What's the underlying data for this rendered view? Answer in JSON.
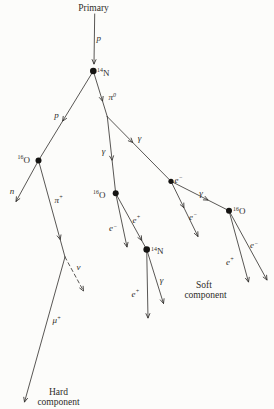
{
  "figure": {
    "caption_labels": {
      "primary": "Primary",
      "soft_line1": "Soft",
      "soft_line2": "component",
      "hard_line1": "Hard",
      "hard_line2": "component"
    },
    "particles": {
      "proton": "p",
      "neutron": "n",
      "pion_neutral_base": "π",
      "pion_neutral_sup": "0",
      "pion_plus_base": "π",
      "pion_plus_sup": "+",
      "muon_base": "μ",
      "muon_sup": "+",
      "neutrino": "ν",
      "gamma": "γ",
      "electron_base": "e",
      "electron_sup": "−",
      "positron_base": "e",
      "positron_sup": "+",
      "nitrogen_sup": "14",
      "nitrogen_base": "N",
      "oxygen_sup": "16",
      "oxygen_base": "O"
    }
  },
  "diagram": {
    "canvas": {
      "w": 274,
      "h": 409,
      "bg": "#fcfcfa",
      "ink": "#2e2c29"
    },
    "dots": [
      {
        "name": "n14-top-vertex-dot",
        "x": 93.3,
        "y": 71,
        "r": 3.3
      },
      {
        "name": "o16-left-vertex-dot",
        "x": 38.5,
        "y": 160.5,
        "r": 3.0
      },
      {
        "name": "o16-center-vertex-dot",
        "x": 115.7,
        "y": 193.3,
        "r": 3.0
      },
      {
        "name": "electron-vertex-dot",
        "x": 171,
        "y": 181.3,
        "r": 2.6
      },
      {
        "name": "o16-right-vertex-dot",
        "x": 229,
        "y": 210.7,
        "r": 3.0
      },
      {
        "name": "n14-bottom-vertex-dot",
        "x": 146.7,
        "y": 249.5,
        "r": 3.3
      }
    ],
    "edges": [
      {
        "name": "primary-proton-track",
        "x1": 94.7,
        "y1": 14,
        "x2": 94,
        "y2": 64,
        "arrows": [
          1
        ],
        "dashed": false
      },
      {
        "name": "proton-track",
        "x1": 93.3,
        "y1": 71,
        "x2": 38.5,
        "y2": 160.5,
        "arrows": [
          0.56
        ],
        "dashed": false
      },
      {
        "name": "pion0-track",
        "x1": 93.3,
        "y1": 71,
        "x2": 107.3,
        "y2": 116.7,
        "arrows": [
          0.66
        ],
        "dashed": false
      },
      {
        "name": "neutron-track",
        "x1": 38.5,
        "y1": 160.5,
        "x2": 16,
        "y2": 201.5,
        "arrows": [
          1
        ],
        "dashed": false
      },
      {
        "name": "pion-plus-track",
        "x1": 38.5,
        "y1": 160.5,
        "x2": 65,
        "y2": 257,
        "arrows": [
          0.82
        ],
        "dashed": false
      },
      {
        "name": "neutrino-track",
        "x1": 65,
        "y1": 257,
        "x2": 83.5,
        "y2": 291,
        "arrows": [
          1
        ],
        "dashed": true
      },
      {
        "name": "muon-track",
        "x1": 65,
        "y1": 257,
        "x2": 24.5,
        "y2": 402,
        "arrows": [
          1
        ],
        "dashed": false
      },
      {
        "name": "gamma-left-track",
        "x1": 107.3,
        "y1": 116.7,
        "x2": 115.7,
        "y2": 193.3,
        "arrows": [
          0.57
        ],
        "dashed": false
      },
      {
        "name": "gamma-right-track",
        "x1": 107.3,
        "y1": 116.7,
        "x2": 171,
        "y2": 181.3,
        "arrows": [
          0.4
        ],
        "dashed": false
      },
      {
        "name": "electron-center-track",
        "x1": 115.7,
        "y1": 193.3,
        "x2": 127,
        "y2": 247,
        "arrows": [
          1
        ],
        "dashed": false
      },
      {
        "name": "positron-center-track",
        "x1": 115.7,
        "y1": 193.3,
        "x2": 146.7,
        "y2": 249.5,
        "arrows": [
          0.84
        ],
        "dashed": false
      },
      {
        "name": "positron-n14-track",
        "x1": 146.7,
        "y1": 249.5,
        "x2": 148,
        "y2": 318,
        "arrows": [
          1
        ],
        "dashed": false
      },
      {
        "name": "gamma-n14-track",
        "x1": 146.7,
        "y1": 249.5,
        "x2": 163.5,
        "y2": 303.5,
        "arrows": [
          1
        ],
        "dashed": false
      },
      {
        "name": "electron-cascade-track",
        "x1": 171,
        "y1": 181.3,
        "x2": 198,
        "y2": 236.5,
        "arrows": [
          0.48,
          1
        ],
        "dashed": false
      },
      {
        "name": "gamma-mid-track",
        "x1": 171,
        "y1": 181.3,
        "x2": 229,
        "y2": 210.7,
        "arrows": [
          0.64
        ],
        "dashed": false
      },
      {
        "name": "positron-right-track",
        "x1": 229,
        "y1": 210.7,
        "x2": 248.5,
        "y2": 282,
        "arrows": [
          1
        ],
        "dashed": false
      },
      {
        "name": "electron-right-track",
        "x1": 229,
        "y1": 210.7,
        "x2": 267,
        "y2": 280,
        "arrows": [
          1
        ],
        "dashed": false
      }
    ],
    "labels": [
      {
        "name": "primary-label",
        "x": 93.5,
        "y": 11,
        "anchor": "middle",
        "italic": false,
        "size": 9.5,
        "parts": [
          {
            "t": "Primary"
          }
        ]
      },
      {
        "name": "proton-top-label",
        "x": 98.8,
        "y": 41,
        "anchor": "middle",
        "italic": true,
        "size": 9,
        "parts": [
          {
            "t": "p"
          }
        ]
      },
      {
        "name": "n14-top-label",
        "x": 97,
        "y": 75.5,
        "anchor": "start",
        "italic": false,
        "size": 9,
        "parts": [
          {
            "t": "14",
            "sup": true
          },
          {
            "t": "N"
          }
        ]
      },
      {
        "name": "proton-left-label",
        "x": 56.5,
        "y": 118,
        "anchor": "middle",
        "italic": true,
        "size": 9,
        "parts": [
          {
            "t": "p"
          }
        ]
      },
      {
        "name": "pion0-label",
        "x": 108.5,
        "y": 100,
        "anchor": "start",
        "italic": true,
        "size": 9,
        "parts": [
          {
            "t": "π"
          },
          {
            "t": "0",
            "sup": true
          }
        ]
      },
      {
        "name": "o16-left-label",
        "x": 17.5,
        "y": 162.5,
        "anchor": "start",
        "italic": false,
        "size": 9,
        "parts": [
          {
            "t": "16",
            "sup": true
          },
          {
            "t": "O"
          }
        ]
      },
      {
        "name": "neutron-label",
        "x": 12,
        "y": 194,
        "anchor": "middle",
        "italic": true,
        "size": 9,
        "parts": [
          {
            "t": "n"
          }
        ]
      },
      {
        "name": "pion-plus-label",
        "x": 54.5,
        "y": 202.5,
        "anchor": "start",
        "italic": true,
        "size": 9,
        "parts": [
          {
            "t": "π"
          },
          {
            "t": "+",
            "sup": true
          }
        ]
      },
      {
        "name": "neutrino-label",
        "x": 78.5,
        "y": 270,
        "anchor": "middle",
        "italic": true,
        "size": 9,
        "parts": [
          {
            "t": "ν"
          }
        ]
      },
      {
        "name": "muon-label",
        "x": 52.5,
        "y": 323,
        "anchor": "start",
        "italic": true,
        "size": 9,
        "parts": [
          {
            "t": "μ"
          },
          {
            "t": "+",
            "sup": true
          }
        ]
      },
      {
        "name": "gamma-left-label",
        "x": 103.5,
        "y": 154,
        "anchor": "middle",
        "italic": true,
        "size": 9,
        "parts": [
          {
            "t": "γ"
          }
        ]
      },
      {
        "name": "gamma-upper-right-label",
        "x": 139.5,
        "y": 141,
        "anchor": "middle",
        "italic": true,
        "size": 9,
        "parts": [
          {
            "t": "γ"
          }
        ]
      },
      {
        "name": "o16-center-label",
        "x": 93,
        "y": 197.5,
        "anchor": "start",
        "italic": false,
        "size": 9,
        "parts": [
          {
            "t": "16",
            "sup": true
          },
          {
            "t": "O"
          }
        ]
      },
      {
        "name": "electron-center-label",
        "x": 109,
        "y": 231,
        "anchor": "start",
        "italic": true,
        "size": 9,
        "parts": [
          {
            "t": "e"
          },
          {
            "t": "−",
            "sup": true
          }
        ]
      },
      {
        "name": "positron-center-label",
        "x": 132.5,
        "y": 222.5,
        "anchor": "start",
        "italic": true,
        "size": 9,
        "parts": [
          {
            "t": "e"
          },
          {
            "t": "+",
            "sup": true
          }
        ]
      },
      {
        "name": "n14-bottom-label",
        "x": 151,
        "y": 254,
        "anchor": "start",
        "italic": false,
        "size": 9,
        "parts": [
          {
            "t": "14",
            "sup": true
          },
          {
            "t": "N"
          }
        ]
      },
      {
        "name": "positron-n14-label",
        "x": 131.5,
        "y": 296.5,
        "anchor": "start",
        "italic": true,
        "size": 9,
        "parts": [
          {
            "t": "e"
          },
          {
            "t": "+",
            "sup": true
          }
        ]
      },
      {
        "name": "gamma-n14-label",
        "x": 161.5,
        "y": 283,
        "anchor": "middle",
        "italic": true,
        "size": 9,
        "parts": [
          {
            "t": "γ"
          }
        ]
      },
      {
        "name": "electron-dot-label",
        "x": 174.5,
        "y": 182.5,
        "anchor": "start",
        "italic": true,
        "size": 9,
        "parts": [
          {
            "t": "e"
          },
          {
            "t": "−",
            "sup": true
          }
        ]
      },
      {
        "name": "electron-cascade-label",
        "x": 189,
        "y": 219.5,
        "anchor": "start",
        "italic": true,
        "size": 9,
        "parts": [
          {
            "t": "e"
          },
          {
            "t": "−",
            "sup": true
          }
        ]
      },
      {
        "name": "gamma-mid-label",
        "x": 201,
        "y": 196,
        "anchor": "middle",
        "italic": true,
        "size": 9,
        "parts": [
          {
            "t": "γ"
          }
        ]
      },
      {
        "name": "o16-right-label",
        "x": 233,
        "y": 214,
        "anchor": "start",
        "italic": false,
        "size": 9,
        "parts": [
          {
            "t": "16",
            "sup": true
          },
          {
            "t": "O"
          }
        ]
      },
      {
        "name": "positron-right-label",
        "x": 226,
        "y": 264.5,
        "anchor": "start",
        "italic": true,
        "size": 9,
        "parts": [
          {
            "t": "e"
          },
          {
            "t": "+",
            "sup": true
          }
        ]
      },
      {
        "name": "electron-right-label",
        "x": 250,
        "y": 248,
        "anchor": "start",
        "italic": true,
        "size": 9,
        "parts": [
          {
            "t": "e"
          },
          {
            "t": "−",
            "sup": true
          }
        ]
      },
      {
        "name": "soft-component-line1",
        "x": 204,
        "y": 288,
        "anchor": "middle",
        "italic": false,
        "size": 9.5,
        "parts": [
          {
            "t": "Soft"
          }
        ]
      },
      {
        "name": "soft-component-line2",
        "x": 205.5,
        "y": 297.5,
        "anchor": "middle",
        "italic": false,
        "size": 9.5,
        "parts": [
          {
            "t": "component"
          }
        ]
      },
      {
        "name": "hard-component-line1",
        "x": 58.5,
        "y": 394.5,
        "anchor": "middle",
        "italic": false,
        "size": 9.5,
        "parts": [
          {
            "t": "Hard"
          }
        ]
      },
      {
        "name": "hard-component-line2",
        "x": 58.5,
        "y": 404.5,
        "anchor": "middle",
        "italic": false,
        "size": 9.5,
        "parts": [
          {
            "t": "component"
          }
        ]
      }
    ]
  }
}
